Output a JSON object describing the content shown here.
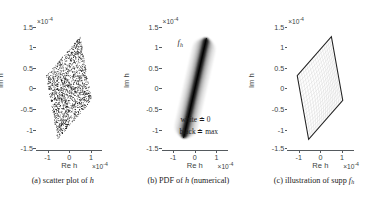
{
  "figure": {
    "background": "#ffffff",
    "axis_color": "#555a5e",
    "text_color": "#3b3f42",
    "panel_count": 3
  },
  "axes_common": {
    "xlabel": "Re h",
    "ylabel": "Im h",
    "x_exponent_mantissa": "×10",
    "x_exponent_power": "-4",
    "y_exponent_mantissa": "×10",
    "y_exponent_power": "-4",
    "xticks": [
      "-1",
      "0",
      "1"
    ],
    "xtick_values": [
      -1,
      0,
      1
    ],
    "yticks": [
      "1.5",
      "1",
      "0.5",
      "0",
      "-0.5",
      "-1",
      "-1.5"
    ],
    "ytick_values": [
      1.5,
      1,
      0.5,
      0,
      -0.5,
      -1,
      -1.5
    ],
    "xlim": [
      -1.45,
      1.45
    ],
    "ylim": [
      -1.75,
      1.75
    ],
    "grid": false
  },
  "panels": [
    {
      "id": "panel-a",
      "letter": "(a)",
      "caption_text": "scatter plot of",
      "caption_italic": "h",
      "caption_sub": "",
      "plot_type": "scatter"
    },
    {
      "id": "panel-b",
      "letter": "(b)",
      "caption_text": "PDF of",
      "caption_italic": "h",
      "caption_tail": "(numerical)",
      "plot_type": "density",
      "inline_label_main": "f",
      "inline_label_sub": "h",
      "annotations": [
        "white ≐ 0",
        "black ≐ max"
      ]
    },
    {
      "id": "panel-c",
      "letter": "(c)",
      "caption_text": "illustration of supp",
      "caption_italic": "f",
      "caption_sub": "h",
      "plot_type": "region-outline"
    }
  ],
  "chart_data": [
    {
      "type": "scatter",
      "title": "(a) scatter plot of h",
      "xlabel": "Re h",
      "ylabel": "Im h",
      "xlim": [
        -1.45,
        1.45
      ],
      "ylim": [
        -1.75,
        1.75
      ],
      "xticks": [
        -1,
        0,
        1
      ],
      "yticks": [
        -1.5,
        -1,
        -0.5,
        0,
        0.5,
        1,
        1.5
      ],
      "x_scale_exponent": -4,
      "y_scale_exponent": -4,
      "grid": false,
      "legend": null,
      "marker": "dot",
      "marker_color": "#000000",
      "point_count_approx": 2000,
      "support_polygon": [
        [
          0.5,
          1.45
        ],
        [
          1.0,
          -0.35
        ],
        [
          -0.5,
          -1.45
        ],
        [
          -1.0,
          0.35
        ]
      ],
      "description": "Dense uniform-like cloud of black dots filling a tilted quadrilateral (parallelogram-like support) spanning Re h from -1 to 1 and Im h from -1.45 to 1.45."
    },
    {
      "type": "heatmap",
      "title": "(b) PDF of h (numerical)",
      "xlabel": "Re h",
      "ylabel": "Im h",
      "xlim": [
        -1.45,
        1.45
      ],
      "ylim": [
        -1.75,
        1.75
      ],
      "xticks": [
        -1,
        0,
        1
      ],
      "yticks": [
        -1.5,
        -1,
        -0.5,
        0,
        0.5,
        1,
        1.5
      ],
      "x_scale_exponent": -4,
      "y_scale_exponent": -4,
      "grid": false,
      "colormap": "grayscale-inverted",
      "colorbar": false,
      "legend_text": [
        "white ≐ 0",
        "black ≐ max"
      ],
      "series_label": "f_h",
      "ridge_endpoints": [
        [
          -0.5,
          -1.4
        ],
        [
          0.5,
          1.4
        ]
      ],
      "ridge_width": 0.12,
      "description": "Narrow high-density diagonal ridge of the probability density f_h running from lower-left (-0.5,-1.4) to upper-right (0.5,1.4), black at the ridge core fading to white away from it."
    },
    {
      "type": "line",
      "title": "(c) illustration of supp f_h",
      "xlabel": "Re h",
      "ylabel": "Im h",
      "xlim": [
        -1.45,
        1.45
      ],
      "ylim": [
        -1.75,
        1.75
      ],
      "xticks": [
        -1,
        0,
        1
      ],
      "yticks": [
        -1.5,
        -1,
        -0.5,
        0,
        0.5,
        1,
        1.5
      ],
      "x_scale_exponent": -4,
      "y_scale_exponent": -4,
      "grid": false,
      "legend": null,
      "outline_color": "#222222",
      "inner_curve_color": "#cfcfcf",
      "support_polygon": [
        [
          0.5,
          1.45
        ],
        [
          1.0,
          -0.35
        ],
        [
          -0.5,
          -1.45
        ],
        [
          -1.0,
          0.35
        ]
      ],
      "inner_family_count": 18,
      "description": "Bold quadrilateral outline of the support of f_h with a faint light-gray family of curved coordinate lines filling its interior."
    }
  ]
}
